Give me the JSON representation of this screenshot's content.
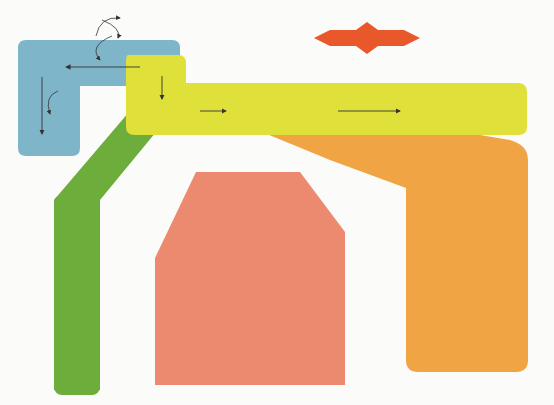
{
  "colors": {
    "blue_region": "#7fb5c9",
    "yellow_region": "#dfe03a",
    "green_region": "#6cad3c",
    "salmon_region": "#ec8a6f",
    "orange_region": "#f0a443",
    "superoxide_star": "#e8582b",
    "arrow": "#333333"
  },
  "top": {
    "gssg": "GSSG",
    "gsh": "GSH",
    "nadp_plus": "NADP⁺",
    "nadph": "NADPH",
    "parp": "PARP",
    "superoxide": "Superóxido",
    "krebs_line1": "Ciclo de Krebs",
    "krebs_line2": "(Mitocôndria)"
  },
  "polyol": {
    "sorbitol": "Sorbitol",
    "nad_plus": "NAD⁺",
    "nadh": "NADH",
    "frutose": "Frutose"
  },
  "glycolysis": {
    "glicose": "Glicose",
    "frutose6p": "Frutose-6-P",
    "gliceraldeido3p": "Gliceraldeído-3-P",
    "gapdh": "GAPDH",
    "difosfoglicerato": "1,3-Difosfoglicerato"
  },
  "hexosamine": {
    "items": [
      "Glicosamina-6-P",
      "UDP-GlcNAc",
      "O-GlcNAc"
    ],
    "derivada": [
      "Derivada de",
      "fatores de",
      "transcrição"
    ],
    "modificacao": [
      "Modificação da",
      "transcrição"
    ],
    "result": "(↑SP1 → ↑TGF-β)"
  },
  "age": {
    "title": "Metiglioxal",
    "age": "AGE",
    "col1_top": [
      "Glicosilação de",
      "proteínas",
      "intracelulares"
    ],
    "col1_bottom": [
      "Alteração de",
      "transcrição"
    ],
    "col2_top": [
      "Glicosilação de",
      "proteínas da matriz",
      "extracelular"
    ],
    "col2_bottom": [
      "Alteração de sinalização/",
      "adesão celular"
    ],
    "col3_age": "AGE",
    "col3_rage": "RAGE",
    "ros": "ROS",
    "nfkb": "NFκB",
    "citocinas": [
      "Citocinas e fatores",
      "de crescimento"
    ]
  },
  "pkc": {
    "title": "Diacilglicerol (DAG)",
    "pkc": "PKC β, δ",
    "effects": [
      "↓eNOS/↑RT-1",
      "↑VEGF",
      "↑VPAI-1",
      "↑NFκB",
      "↑TGF-β",
      "↑NAD(P)H oxidases"
    ]
  }
}
